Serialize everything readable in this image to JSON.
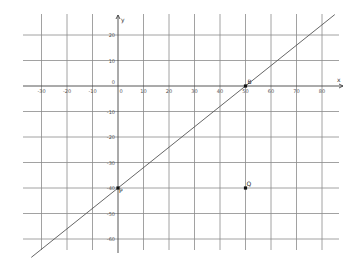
{
  "chart_data": {
    "type": "line",
    "title": "",
    "xlabel": "x",
    "ylabel": "y",
    "xlim": [
      -37,
      88
    ],
    "ylim": [
      -66,
      28
    ],
    "grid": true,
    "x_ticks": [
      -30,
      -20,
      -10,
      0,
      10,
      20,
      30,
      40,
      50,
      60,
      70,
      80
    ],
    "x_tick_labels": [
      "-30",
      "-20",
      "-10",
      "0",
      "10",
      "20",
      "30",
      "40",
      "50",
      "60",
      "70",
      "80"
    ],
    "y_ticks": [
      20,
      10,
      0,
      -10,
      -20,
      -30,
      -40,
      -50,
      -60
    ],
    "y_tick_labels": [
      "20",
      "10",
      "0",
      "-10",
      "-20",
      "-30",
      "-40",
      "-50",
      "-60"
    ],
    "points": [
      {
        "label": "B",
        "x": 50,
        "y": 0
      },
      {
        "label": "P",
        "x": 0,
        "y": -40
      },
      {
        "label": "Q",
        "x": 50,
        "y": -40
      }
    ],
    "series": [
      {
        "name": "line PB",
        "x": [
          -34,
          85
        ],
        "y": [
          -67.2,
          28
        ],
        "slope": 0.8,
        "intercept": -40
      }
    ]
  },
  "labels": {
    "x_axis": "x",
    "y_axis": "y",
    "origin": "0",
    "point_b": "B",
    "point_p": "P",
    "point_q": "Q"
  }
}
